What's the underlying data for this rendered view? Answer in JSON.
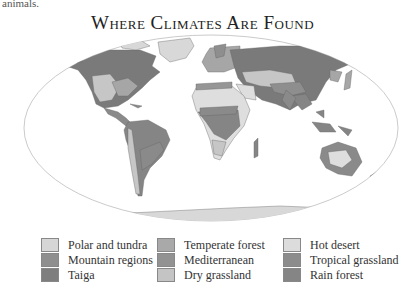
{
  "intro_text": "animals.",
  "title": "Where Climates Are Found",
  "colors": {
    "polar_tundra": "#d8d8d8",
    "mountain": "#8e8e8e",
    "taiga": "#7a7a7a",
    "temperate_forest": "#a6a6a6",
    "mediterranean": "#969696",
    "dry_grassland": "#c6c6c6",
    "hot_desert": "#dedede",
    "tropical_grassland": "#8a8a8a",
    "rain_forest": "#858585",
    "ocean": "#ffffff",
    "frame": "#bdbdbd"
  },
  "legend": {
    "columns": [
      [
        {
          "label": "Polar and tundra",
          "color": "#d6d6d6"
        },
        {
          "label": "Mountain regions",
          "color": "#8f8f8f"
        },
        {
          "label": "Taiga",
          "color": "#7e7e7e"
        }
      ],
      [
        {
          "label": "Temperate forest",
          "color": "#a9a9a9"
        },
        {
          "label": "Mediterranean",
          "color": "#929292"
        },
        {
          "label": "Dry grassland",
          "color": "#c4c4c4"
        }
      ],
      [
        {
          "label": "Hot desert",
          "color": "#dcdcdc"
        },
        {
          "label": "Tropical grassland",
          "color": "#8c8c8c"
        },
        {
          "label": "Rain forest",
          "color": "#858585"
        }
      ]
    ]
  }
}
